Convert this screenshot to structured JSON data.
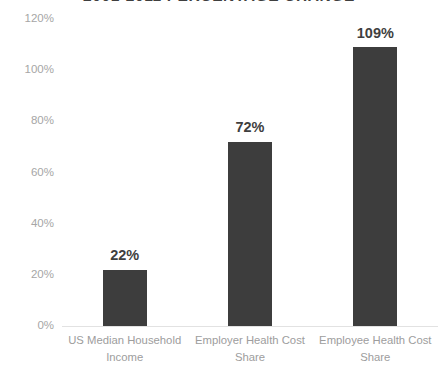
{
  "chart_data": {
    "type": "bar",
    "title": "2001-2011 PERCENTAGE CHANGE",
    "xlabel": "",
    "ylabel": "",
    "ylim": [
      0,
      120
    ],
    "grid": false,
    "legend": "none",
    "categories": [
      "US Median Household Income",
      "Employer Health Cost Share",
      "Employee Health Cost Share"
    ],
    "category_lines": [
      [
        "US Median Household",
        "Income"
      ],
      [
        "Employer Health Cost",
        "Share"
      ],
      [
        "Employee Health Cost",
        "Share"
      ]
    ],
    "values": [
      22,
      72,
      109
    ],
    "data_labels": [
      "22%",
      "72%",
      "109%"
    ],
    "y_ticks": [
      0,
      20,
      40,
      60,
      80,
      100,
      120
    ],
    "y_tick_labels": [
      "0%",
      "20%",
      "40%",
      "60%",
      "80%",
      "100%",
      "120%"
    ]
  },
  "colors": {
    "bar": "#3d3d3d",
    "data_label": "#3f3f3f",
    "axis_text": "#a6a6a6",
    "category_text": "#9d9d9d",
    "baseline": "#e2e2e2",
    "background": "#ffffff"
  }
}
